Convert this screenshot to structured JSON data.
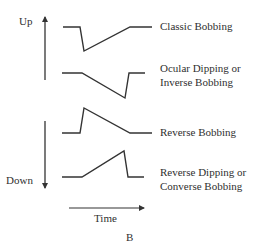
{
  "axes": {
    "up_label": "Up",
    "down_label": "Down",
    "time_label": "Time"
  },
  "panel_label": "B",
  "colors": {
    "stroke": "#333333",
    "text": "#2f2f2f",
    "background": "#ffffff"
  },
  "traces": [
    {
      "name": "Classic Bobbing",
      "label_lines": [
        "Classic Bobbing"
      ],
      "points": "63,27 80,27 84,51 130,27 152,27"
    },
    {
      "name": "Ocular Dipping or Inverse Bobbing",
      "label_lines": [
        "Ocular Dipping or",
        "Inverse Bobbing"
      ],
      "points": "62,73 82,73 125,98 129,73 145,73"
    },
    {
      "name": "Reverse Bobbing",
      "label_lines": [
        "Reverse Bobbing"
      ],
      "points": "62,133 80,133 84,108 130,133 152,133"
    },
    {
      "name": "Reverse Dipping or Converse Bobbing",
      "label_lines": [
        "Reverse Dipping or",
        "Converse Bobbing"
      ],
      "points": "62,177 82,177 124,151 128,177 144,177"
    }
  ]
}
